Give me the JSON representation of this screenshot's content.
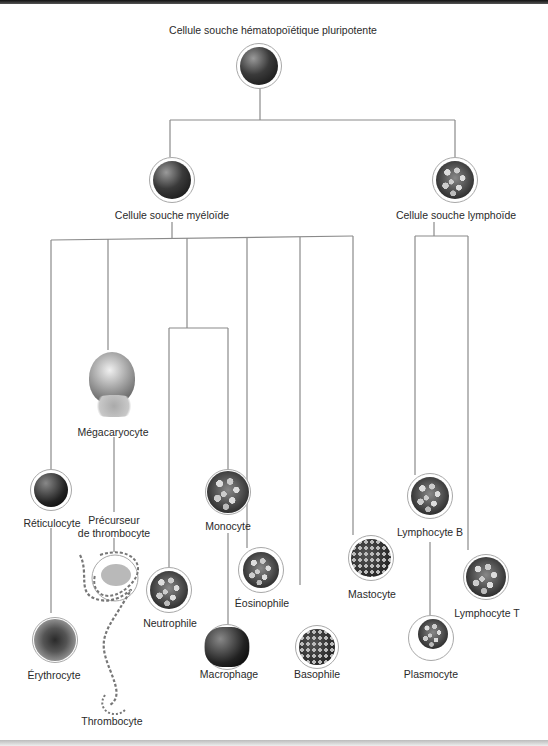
{
  "diagram": {
    "title": "Cellule souche hématopoïétique pluripotente",
    "branches": {
      "myeloid": {
        "label": "Cellule souche myéloïde",
        "children": [
          {
            "label": "Réticulocyte",
            "next": "Érythrocyte"
          },
          {
            "label": "Mégacaryocyte",
            "next": "Précurseur de thrombocyte",
            "final": "Thrombocyte"
          },
          {
            "label": "Monocyte",
            "next": "Macrophage"
          },
          {
            "label": "Neutrophile"
          },
          {
            "label": "Éosinophile"
          },
          {
            "label": "Basophile"
          },
          {
            "label": "Mastocyte"
          }
        ]
      },
      "lymphoid": {
        "label": "Cellule souche lymphoïde",
        "children": [
          {
            "label": "Lymphocyte B",
            "next": "Plasmocyte"
          },
          {
            "label": "Lymphocyte T"
          }
        ]
      }
    },
    "labels": {
      "root": "Cellule souche hématopoïétique pluripotente",
      "myeloid": "Cellule souche myéloïde",
      "lymphoid": "Cellule souche lymphoïde",
      "megakaryocyte": "Mégacaryocyte",
      "reticulocyte": "Réticulocyte",
      "thrombocyte_precursor_line1": "Précurseur",
      "thrombocyte_precursor_line2": "de thrombocyte",
      "monocyte": "Monocyte",
      "erythrocyte": "Érythrocyte",
      "thrombocyte": "Thrombocyte",
      "neutrophil": "Neutrophile",
      "eosinophil": "Éosinophile",
      "macrophage": "Macrophage",
      "basophil": "Basophile",
      "mastocyte": "Mastocyte",
      "lymphocyte_b": "Lymphocyte B",
      "lymphocyte_t": "Lymphocyte T",
      "plasmocyte": "Plasmocyte"
    },
    "colors": {
      "line": "#8a8a8a",
      "cell_ring": "#a8a8a8",
      "text": "#2a2a2a"
    }
  }
}
